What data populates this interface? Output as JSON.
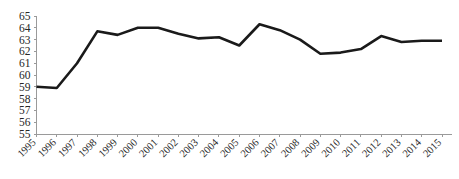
{
  "chart_data": {
    "type": "line",
    "title": "",
    "subtitle": "",
    "xlabel": "",
    "ylabel": "",
    "categories": [
      "1995",
      "1996",
      "1997",
      "1998",
      "1999",
      "2000",
      "2001",
      "2002",
      "2003",
      "2004",
      "2005",
      "2006",
      "2007",
      "2008",
      "2009",
      "2010",
      "2011",
      "2012",
      "2013",
      "2014",
      "2015"
    ],
    "series": [
      {
        "name": "",
        "color": "#1a1a1a",
        "values": [
          59.0,
          58.9,
          61.0,
          63.7,
          63.4,
          64.0,
          64.0,
          63.5,
          63.1,
          63.2,
          62.5,
          64.3,
          63.8,
          63.0,
          61.8,
          61.9,
          62.2,
          63.3,
          62.8,
          62.9,
          62.9
        ]
      }
    ],
    "ylim": [
      55,
      65
    ],
    "yticks": [
      55,
      56,
      57,
      58,
      59,
      60,
      61,
      62,
      63,
      64,
      65
    ],
    "ytick_labels": [
      "55",
      "56",
      "57",
      "58",
      "59",
      "60",
      "61",
      "62",
      "63",
      "64",
      "65"
    ],
    "grid": false,
    "legend": false,
    "legend_position": "none",
    "axis_color": "#9a9a9a",
    "text_color": "#262626",
    "background": "#ffffff",
    "xtick_rotation": -45
  }
}
